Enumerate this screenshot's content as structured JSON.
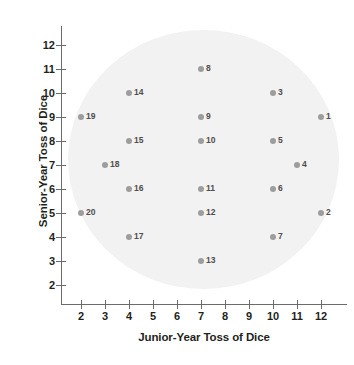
{
  "chart_data": {
    "type": "scatter",
    "title": "",
    "xlabel": "Junior-Year Toss of Dice",
    "ylabel": "Senior-Year Toss of Dice",
    "xlim": [
      2,
      12
    ],
    "ylim": [
      2,
      12
    ],
    "xticks": [
      2,
      3,
      4,
      5,
      6,
      7,
      8,
      9,
      10,
      11,
      12
    ],
    "yticks": [
      2,
      3,
      4,
      5,
      6,
      7,
      8,
      9,
      10,
      11,
      12
    ],
    "xtick_labels": [
      "2",
      "3",
      "4",
      "5",
      "6",
      "7",
      "8",
      "9",
      "10",
      "11",
      "12"
    ],
    "ytick_labels": [
      "2",
      "3",
      "4",
      "5",
      "6",
      "7",
      "8",
      "9",
      "10",
      "11",
      "12"
    ],
    "grid": false,
    "legend": false,
    "point_color": "#9d9d9d",
    "label_color": "#4d4d4d",
    "axis_color": "#6b6b6b",
    "shaded_region": {
      "shape": "ellipse",
      "color": "#f2f2f2",
      "center": [
        9.1,
        8.4
      ],
      "x_radius": 5.6,
      "y_radius": 5.4
    },
    "points": [
      {
        "label": "1",
        "x": 12,
        "y": 9
      },
      {
        "label": "2",
        "x": 12,
        "y": 5
      },
      {
        "label": "3",
        "x": 10,
        "y": 10
      },
      {
        "label": "4",
        "x": 11,
        "y": 7
      },
      {
        "label": "5",
        "x": 10,
        "y": 8
      },
      {
        "label": "6",
        "x": 10,
        "y": 6
      },
      {
        "label": "7",
        "x": 10,
        "y": 4
      },
      {
        "label": "8",
        "x": 7,
        "y": 11
      },
      {
        "label": "9",
        "x": 7,
        "y": 9
      },
      {
        "label": "10",
        "x": 7,
        "y": 8
      },
      {
        "label": "11",
        "x": 7,
        "y": 6
      },
      {
        "label": "12",
        "x": 7,
        "y": 5
      },
      {
        "label": "13",
        "x": 7,
        "y": 3
      },
      {
        "label": "14",
        "x": 4,
        "y": 10
      },
      {
        "label": "15",
        "x": 4,
        "y": 8
      },
      {
        "label": "16",
        "x": 4,
        "y": 6
      },
      {
        "label": "17",
        "x": 4,
        "y": 4
      },
      {
        "label": "18",
        "x": 3,
        "y": 7
      },
      {
        "label": "19",
        "x": 2,
        "y": 9
      },
      {
        "label": "20",
        "x": 2,
        "y": 5
      }
    ]
  }
}
